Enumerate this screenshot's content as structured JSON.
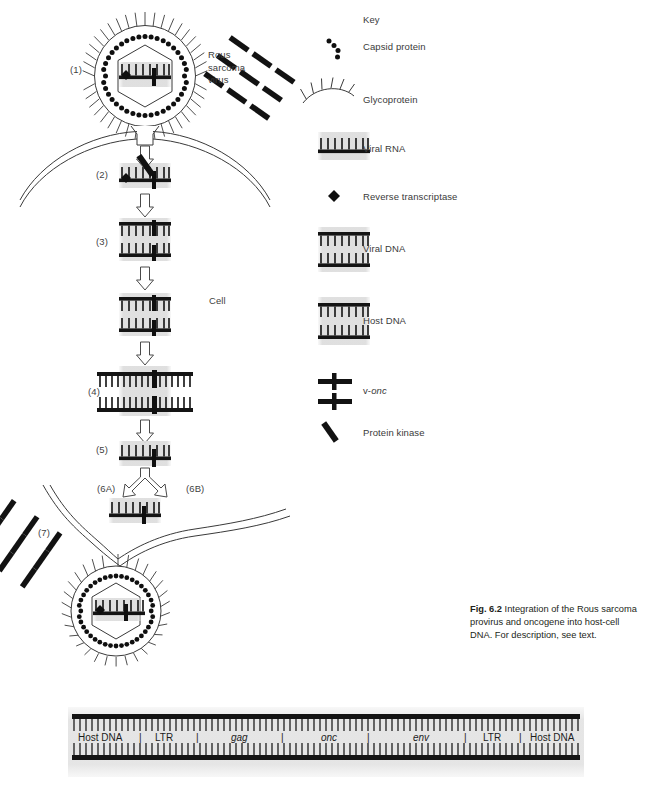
{
  "figure": {
    "number": "Fig. 6.2",
    "caption_text": " Integration of the Rous sarcoma provirus and oncogene into host-cell DNA. For description, see text.",
    "organelle_label": "Cell",
    "virus_label_line1": "Rous",
    "virus_label_line2": "sarcoma",
    "virus_label_line3": "virus"
  },
  "steps": [
    {
      "id": "1",
      "label": "(1)"
    },
    {
      "id": "2",
      "label": "(2)"
    },
    {
      "id": "3",
      "label": "(3)"
    },
    {
      "id": "4",
      "label": "(4)"
    },
    {
      "id": "5",
      "label": "(5)"
    },
    {
      "id": "6A",
      "label": "(6A)"
    },
    {
      "id": "6B",
      "label": "(6B)"
    },
    {
      "id": "7",
      "label": "(7)"
    }
  ],
  "key": {
    "title": "Key",
    "items": [
      {
        "icon": "capsid-protein-icon",
        "label": "Capsid protein"
      },
      {
        "icon": "glycoprotein-icon",
        "label": "Glycoprotein"
      },
      {
        "icon": "viral-rna-icon",
        "label": "Viral RNA"
      },
      {
        "icon": "reverse-transcriptase-icon",
        "label": "Reverse transcriptase"
      },
      {
        "icon": "viral-dna-icon",
        "label": "Viral DNA"
      },
      {
        "icon": "host-dna-icon",
        "label": "Host DNA"
      },
      {
        "icon": "v-onc-icon",
        "label": "v-onc",
        "label_prefix": "v-",
        "label_italic": "onc"
      },
      {
        "icon": "protein-kinase-icon",
        "label": "Protein kinase"
      }
    ]
  },
  "gene_map": {
    "segments": [
      {
        "name": "Host DNA",
        "italic": false
      },
      {
        "name": "LTR",
        "italic": false
      },
      {
        "name": "gag",
        "italic": true
      },
      {
        "name": "onc",
        "italic": true
      },
      {
        "name": "env",
        "italic": true
      },
      {
        "name": "LTR",
        "italic": false
      },
      {
        "name": "Host DNA",
        "italic": false
      }
    ],
    "separator": "|"
  },
  "colors": {
    "ink": "#231f20",
    "line": "#3a3a3a",
    "dna_bar": "#161616",
    "dna_teeth": "#2a2a2a",
    "panel_bg": "#e6e6e6",
    "page_bg": "#ffffff"
  }
}
